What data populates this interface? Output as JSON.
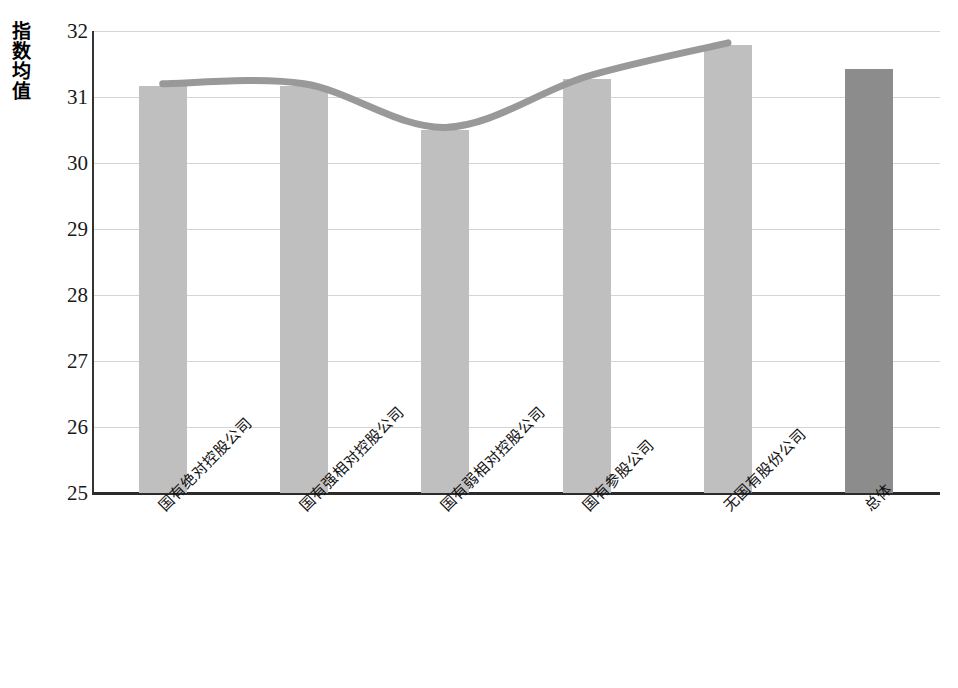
{
  "chart_data": {
    "type": "bar",
    "title": "",
    "xlabel": "",
    "ylabel": "指数均值",
    "ylim": [
      25,
      32
    ],
    "yticks": [
      "25",
      "26",
      "27",
      "28",
      "29",
      "30",
      "31",
      "32"
    ],
    "grid": true,
    "legend": "none",
    "categories": [
      "国有绝对控股公司",
      "国有强相对控股公司",
      "国有弱相对控股公司",
      "国有参股公司",
      "无国有股份公司",
      "总体"
    ],
    "series": [
      {
        "name": "指数均值",
        "type": "bar",
        "values": [
          31.17,
          31.17,
          30.5,
          31.27,
          31.79,
          31.42
        ],
        "colors": [
          "#bfbfbf",
          "#bfbfbf",
          "#bfbfbf",
          "#bfbfbf",
          "#bfbfbf",
          "#8c8c8c"
        ]
      },
      {
        "name": "趋势线",
        "type": "line",
        "color": "#999999",
        "values": [
          31.2,
          31.2,
          30.54,
          31.31,
          31.82,
          null
        ]
      }
    ],
    "annotations": []
  },
  "axis": {
    "y_title": "指数均值",
    "tick_25": "25",
    "tick_26": "26",
    "tick_27": "27",
    "tick_28": "28",
    "tick_29": "29",
    "tick_30": "30",
    "tick_31": "31",
    "tick_32": "32"
  },
  "xlabels": {
    "l0": "国有绝对控股公司",
    "l1": "国有强相对控股公司",
    "l2": "国有弱相对控股公司",
    "l3": "国有参股公司",
    "l4": "无国有股份公司",
    "l5": "总体"
  },
  "colors": {
    "bar": "#bfbfbf",
    "bar_total": "#8c8c8c",
    "line": "#999999",
    "grid": "#d4d4d4",
    "axis": "#2b2b2b",
    "text": "#111111"
  }
}
